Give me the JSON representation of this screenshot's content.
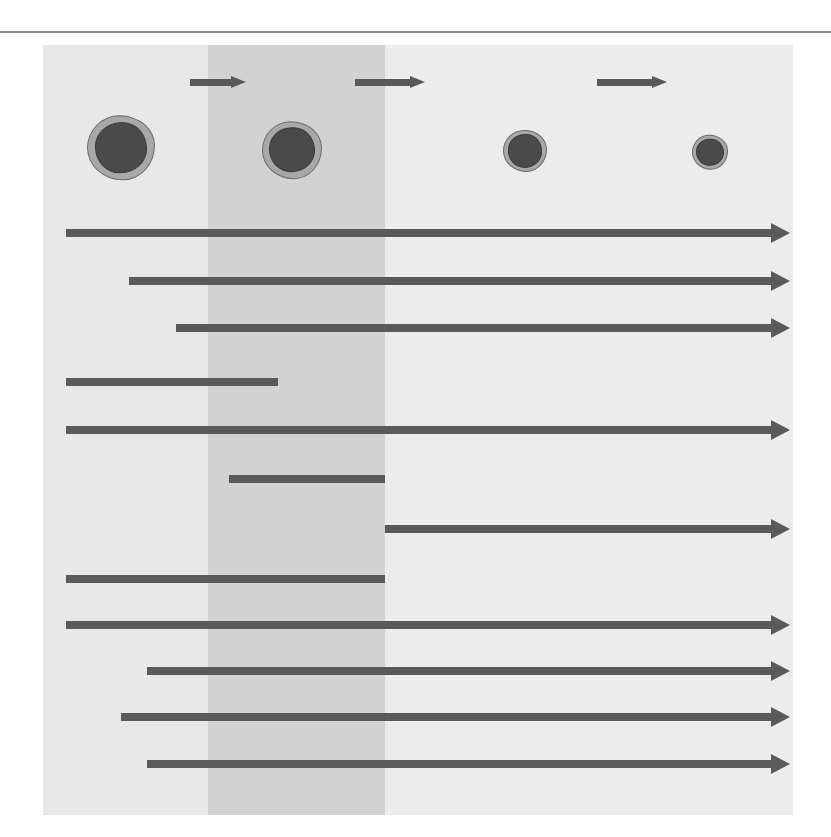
{
  "figure": {
    "panel": {
      "x": 43,
      "y": 45,
      "width": 750,
      "height": 770
    },
    "colors": {
      "band_light": "#e8e8e8",
      "band_mid": "#d2d2d2",
      "band_lighter": "#ececec",
      "bar": "#5a5a5a",
      "stage_arrow": "#595959",
      "cytoplasm": "#a8a8a8",
      "nucleus": "#4a4a4a",
      "text": "#1b1b1b",
      "rule": "#8d8d8d"
    }
  },
  "stages": [
    {
      "label": "Pro-B",
      "label_x": 121,
      "cell_cx": 121,
      "cell_cy": 148,
      "cell_r": 34,
      "nucleus_r": 26
    },
    {
      "label": "Pre-B",
      "label_x": 292,
      "cell_cx": 292,
      "cell_cy": 150,
      "cell_r": 30,
      "nucleus_r": 23
    },
    {
      "label": "Early B",
      "label_x": 525,
      "cell_cx": 525,
      "cell_cy": 151,
      "cell_r": 22,
      "nucleus_r": 17
    },
    {
      "label": "Mature B",
      "label_x": 710,
      "cell_cx": 710,
      "cell_cy": 152,
      "cell_r": 18,
      "nucleus_r": 14
    }
  ],
  "stage_arrows": [
    {
      "name": "pro-b-to-pre-b",
      "x": 190,
      "y": 82,
      "length": 56
    },
    {
      "name": "pre-b-to-early-b",
      "x": 355,
      "y": 82,
      "length": 70
    },
    {
      "name": "early-b-to-mature-b",
      "x": 597,
      "y": 82,
      "length": 70
    }
  ],
  "bands": [
    {
      "name": "pro-b-band",
      "left": 0,
      "width": 165,
      "color": "#e8e8e8"
    },
    {
      "name": "pre-b-band",
      "left": 165,
      "width": 177,
      "color": "#d2d2d2"
    },
    {
      "name": "post-pre-b-band",
      "left": 342,
      "width": 408,
      "color": "#ececec"
    }
  ],
  "markers": [
    {
      "label": "Heavy chain gene rearranged",
      "label_x": 66,
      "label_y": 205,
      "bar_x": 66,
      "bar_end": 771,
      "bar_y": 229,
      "arrow": true
    },
    {
      "label": "κ light chain gene rearranged",
      "label_x": 129,
      "label_y": 253,
      "bar_x": 129,
      "bar_end": 771,
      "bar_y": 277,
      "arrow": true
    },
    {
      "label": "λ light chain gene rearranged",
      "label_x": 176,
      "label_y": 300,
      "bar_x": 176,
      "bar_end": 771,
      "bar_y": 324,
      "arrow": true
    },
    {
      "label": "TdT",
      "label_x": 66,
      "label_y": 354,
      "bar_x": 66,
      "bar_end": 278,
      "bar_y": 378,
      "arrow": false
    },
    {
      "label": "HLA-DR",
      "label_x": 66,
      "label_y": 402,
      "bar_x": 66,
      "bar_end": 771,
      "bar_y": 426,
      "arrow": true
    },
    {
      "label": "Cytoplasmic",
      "label_x": 229,
      "label_y": 451,
      "bar_x": 229,
      "bar_end": 385,
      "bar_y": 475,
      "arrow": false
    },
    {
      "label": "Surface immunoglobin",
      "label_x": 398,
      "label_y": 501,
      "bar_x": 385,
      "bar_end": 771,
      "bar_y": 525,
      "arrow": true
    },
    {
      "label": "CD10",
      "label_x": 66,
      "label_y": 551,
      "bar_x": 66,
      "bar_end": 385,
      "bar_y": 575,
      "arrow": false
    },
    {
      "label": "CD19",
      "label_x": 66,
      "label_y": 597,
      "bar_x": 66,
      "bar_end": 771,
      "bar_y": 621,
      "arrow": true
    },
    {
      "label": "CD20",
      "label_x": 147,
      "label_y": 643,
      "bar_x": 147,
      "bar_end": 771,
      "bar_y": 667,
      "arrow": true
    },
    {
      "label": "PAX5",
      "label_x": 121,
      "label_y": 689,
      "bar_x": 121,
      "bar_end": 771,
      "bar_y": 713,
      "arrow": true
    },
    {
      "label": "CD79a",
      "label_x": 147,
      "label_y": 736,
      "bar_x": 147,
      "bar_end": 771,
      "bar_y": 760,
      "arrow": true
    }
  ]
}
